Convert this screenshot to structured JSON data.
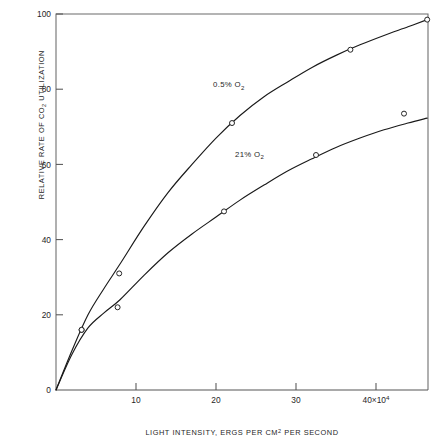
{
  "chart_data": {
    "type": "line",
    "title": "",
    "subtitle": "",
    "xlabel": "LIGHT INTENSITY, ERGS PER CM2 PER SECOND",
    "xlabel_parts": {
      "pre": "LIGHT INTENSITY, ERGS PER CM",
      "sup": "2",
      "post": " PER SECOND"
    },
    "ylabel": "RELATIVE RATE OF CO2 UTILIZATION",
    "ylabel_parts": {
      "pre": "RELATIVE RATE OF CO",
      "sub": "2",
      "post": " UTILIZATION"
    },
    "xlim": [
      0,
      46.5
    ],
    "ylim": [
      0,
      100
    ],
    "x_tick_values": [
      10,
      20,
      30,
      40
    ],
    "x_tick_labels": [
      "10",
      "20",
      "30",
      "40×10⁴"
    ],
    "x_tick_exponent_note": "40×10⁴",
    "y_tick_values": [
      0,
      20,
      40,
      60,
      80,
      100
    ],
    "y_tick_labels": [
      "0",
      "20",
      "40",
      "60",
      "80",
      "100"
    ],
    "x_unit_multiplier": "×10⁴",
    "grid": false,
    "legend_position": "inline-curve-labels",
    "axis_color": "#555555",
    "curve_color": "#1a1a1a",
    "marker_fill": "#ffffff",
    "background": "#ffffff",
    "series": [
      {
        "name": "0.5% O2",
        "label_parts": {
          "pre": "0.5% O",
          "sub": "2"
        },
        "label_x": 21.6,
        "label_y": 80.5,
        "marker": "open-circle",
        "points": [
          {
            "x": 0.0,
            "y": 0
          },
          {
            "x": 3.2,
            "y": 16
          },
          {
            "x": 7.9,
            "y": 31
          },
          {
            "x": 22.0,
            "y": 71
          },
          {
            "x": 36.8,
            "y": 90.5
          },
          {
            "x": 46.4,
            "y": 98.5
          }
        ],
        "curve_points": [
          {
            "x": 0.0,
            "y": 0
          },
          {
            "x": 2.0,
            "y": 10.5
          },
          {
            "x": 4.0,
            "y": 20.0
          },
          {
            "x": 6.0,
            "y": 27.0
          },
          {
            "x": 8.0,
            "y": 33.5
          },
          {
            "x": 11.0,
            "y": 43.5
          },
          {
            "x": 14.0,
            "y": 52.5
          },
          {
            "x": 17.0,
            "y": 60.0
          },
          {
            "x": 20.0,
            "y": 67.0
          },
          {
            "x": 23.0,
            "y": 73.0
          },
          {
            "x": 26.0,
            "y": 78.0
          },
          {
            "x": 29.0,
            "y": 82.0
          },
          {
            "x": 32.0,
            "y": 85.8
          },
          {
            "x": 35.0,
            "y": 89.0
          },
          {
            "x": 38.0,
            "y": 91.8
          },
          {
            "x": 41.0,
            "y": 94.3
          },
          {
            "x": 44.0,
            "y": 96.6
          },
          {
            "x": 46.4,
            "y": 98.5
          }
        ]
      },
      {
        "name": "21% O2",
        "label_parts": {
          "pre": "21% O",
          "sub": "2"
        },
        "label_x": 24.2,
        "label_y": 62.0,
        "marker": "open-circle",
        "points": [
          {
            "x": 0.0,
            "y": 0
          },
          {
            "x": 3.2,
            "y": 16
          },
          {
            "x": 7.7,
            "y": 22
          },
          {
            "x": 21.0,
            "y": 47.5
          },
          {
            "x": 32.5,
            "y": 62.5
          },
          {
            "x": 43.5,
            "y": 73.5
          }
        ],
        "curve_points": [
          {
            "x": 0.0,
            "y": 0
          },
          {
            "x": 2.0,
            "y": 9.5
          },
          {
            "x": 4.0,
            "y": 16.5
          },
          {
            "x": 6.0,
            "y": 20.5
          },
          {
            "x": 8.0,
            "y": 24.0
          },
          {
            "x": 11.0,
            "y": 30.5
          },
          {
            "x": 14.0,
            "y": 36.5
          },
          {
            "x": 17.0,
            "y": 41.5
          },
          {
            "x": 20.0,
            "y": 46.0
          },
          {
            "x": 23.0,
            "y": 50.5
          },
          {
            "x": 26.0,
            "y": 54.5
          },
          {
            "x": 29.0,
            "y": 58.3
          },
          {
            "x": 32.0,
            "y": 61.5
          },
          {
            "x": 35.0,
            "y": 64.5
          },
          {
            "x": 38.0,
            "y": 67.0
          },
          {
            "x": 41.0,
            "y": 69.2
          },
          {
            "x": 44.0,
            "y": 71.0
          },
          {
            "x": 46.4,
            "y": 72.3
          }
        ]
      }
    ]
  }
}
